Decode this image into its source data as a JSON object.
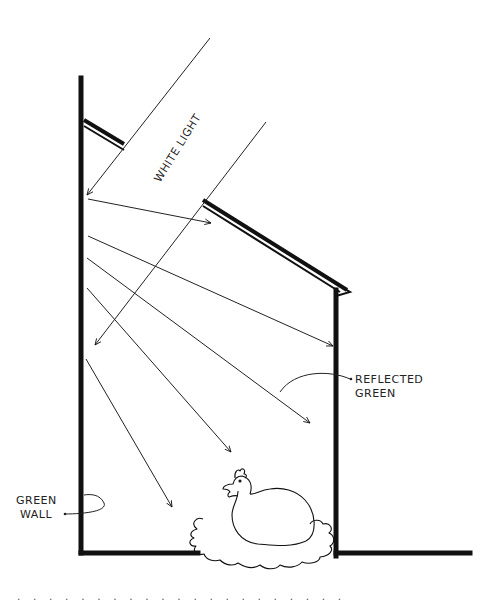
{
  "diagram": {
    "labels": {
      "white_light": "WHITE LIGHT",
      "reflected_green_line1": "REFLECTED",
      "reflected_green_line2": "GREEN",
      "green_wall_line1": "GREEN",
      "green_wall_line2": "WALL"
    },
    "elements": [
      "left-wall",
      "right-wall",
      "floor",
      "sloped-roof",
      "white-light-beam",
      "reflected-rays",
      "hen-on-nest"
    ],
    "footer_dots": ". . . . . . . . . . . . . . . . . . . . ."
  },
  "colors": {
    "ink": "#111111",
    "background": "#ffffff"
  }
}
